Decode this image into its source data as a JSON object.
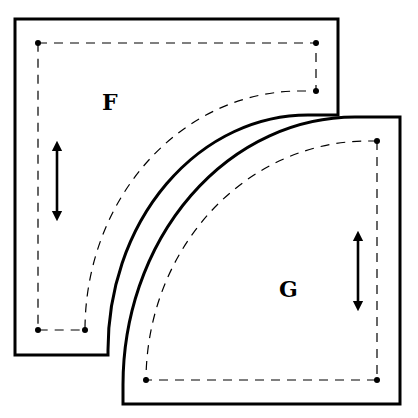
{
  "diagram": {
    "type": "quilt-pattern-pieces",
    "colors": {
      "line": "#000000",
      "background": "#ffffff"
    },
    "pieces": [
      {
        "id": "piece-F",
        "label": "F",
        "shape": "square with concave quarter-circle cutout",
        "grainline": "vertical double-headed arrow"
      },
      {
        "id": "piece-G",
        "label": "G",
        "shape": "quarter circle",
        "grainline": "vertical double-headed arrow"
      }
    ],
    "legend": {
      "solid_line": "cutting line",
      "dashed_line": "sewing line",
      "dots": "seam corner points"
    }
  }
}
